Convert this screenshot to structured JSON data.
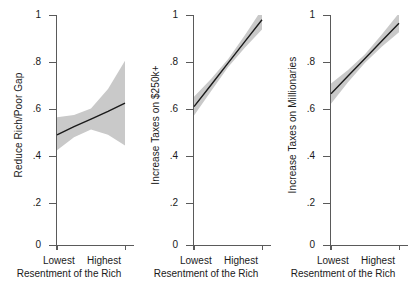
{
  "figure": {
    "panel_count": 3,
    "band_color": "#c9c9c9",
    "line_color": "#1a1a1a",
    "axis_color": "#5a5a5a"
  },
  "chart_data": [
    {
      "type": "line",
      "title": "",
      "ylabel": "Reduce Rich/Poor Gap",
      "xlabel": "Resentment of the Rich",
      "ylim": [
        0,
        1
      ],
      "yticks": [
        0,
        0.2,
        0.4,
        0.6,
        0.8,
        1
      ],
      "ytick_labels": [
        "0",
        ".2",
        ".4",
        ".6",
        ".8",
        "1"
      ],
      "xlim": [
        0,
        1
      ],
      "xtick_labels": [
        "Lowest",
        "Highest"
      ],
      "grid": false,
      "legend": "none",
      "x": [
        0,
        0.25,
        0.5,
        0.75,
        1
      ],
      "values": [
        0.49,
        0.525,
        0.557,
        0.59,
        0.625
      ],
      "ci_lower": [
        0.425,
        0.48,
        0.513,
        0.49,
        0.445
      ],
      "ci_upper": [
        0.565,
        0.575,
        0.602,
        0.685,
        0.805
      ],
      "series": [
        {
          "name": "Predicted support",
          "values": [
            0.49,
            0.525,
            0.557,
            0.59,
            0.625
          ]
        }
      ]
    },
    {
      "type": "line",
      "title": "",
      "ylabel": "Increase Taxes on $250k+",
      "xlabel": "Resentment of the Rich",
      "ylim": [
        0,
        1
      ],
      "yticks": [
        0,
        0.2,
        0.4,
        0.6,
        0.8,
        1
      ],
      "ytick_labels": [
        "0",
        ".2",
        ".4",
        ".6",
        ".8",
        "1"
      ],
      "xlim": [
        0,
        1
      ],
      "xtick_labels": [
        "Lowest",
        "Highest"
      ],
      "grid": false,
      "legend": "none",
      "x": [
        0,
        0.25,
        0.5,
        0.75,
        1
      ],
      "values": [
        0.61,
        0.702,
        0.795,
        0.888,
        0.98
      ],
      "ci_lower": [
        0.572,
        0.676,
        0.778,
        0.862,
        0.938
      ],
      "ci_upper": [
        0.652,
        0.728,
        0.812,
        0.915,
        1.025
      ],
      "series": [
        {
          "name": "Predicted support",
          "values": [
            0.61,
            0.702,
            0.795,
            0.888,
            0.98
          ]
        }
      ]
    },
    {
      "type": "line",
      "title": "",
      "ylabel": "Increase Taxes on Millionaries",
      "xlabel": "Resentment of the Rich",
      "ylim": [
        0,
        1
      ],
      "yticks": [
        0,
        0.2,
        0.4,
        0.6,
        0.8,
        1
      ],
      "ytick_labels": [
        "0",
        ".2",
        ".4",
        ".6",
        ".8",
        "1"
      ],
      "xlim": [
        0,
        1
      ],
      "xtick_labels": [
        "Lowest",
        "Highest"
      ],
      "grid": false,
      "legend": "none",
      "x": [
        0,
        0.25,
        0.5,
        0.75,
        1
      ],
      "values": [
        0.665,
        0.74,
        0.815,
        0.89,
        0.965
      ],
      "ci_lower": [
        0.622,
        0.714,
        0.797,
        0.866,
        0.927
      ],
      "ci_upper": [
        0.708,
        0.766,
        0.833,
        0.918,
        1.008
      ],
      "series": [
        {
          "name": "Predicted support",
          "values": [
            0.665,
            0.74,
            0.815,
            0.89,
            0.965
          ]
        }
      ]
    }
  ]
}
